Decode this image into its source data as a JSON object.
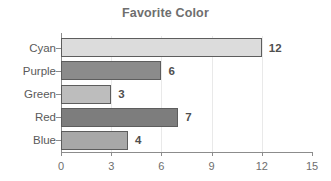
{
  "chart_data": {
    "type": "bar",
    "orientation": "horizontal",
    "title": "Favorite Color",
    "xlabel": "",
    "ylabel": "",
    "categories": [
      "Cyan",
      "Purple",
      "Green",
      "Red",
      "Blue"
    ],
    "values": [
      12,
      6,
      3,
      7,
      4
    ],
    "value_labels": [
      "12",
      "6",
      "3",
      "7",
      "4"
    ],
    "xlim": [
      0,
      15
    ],
    "xticks": [
      0,
      3,
      6,
      9,
      12,
      15
    ],
    "xtick_labels": [
      "0",
      "3",
      "6",
      "9",
      "12",
      "15"
    ],
    "gridlines": [
      3,
      6,
      9,
      12
    ],
    "grid": true,
    "legend": null,
    "bar_colors": [
      "#dcdcdc",
      "#8b8b8b",
      "#bdbdbd",
      "#7d7d7d",
      "#a8a8a8"
    ],
    "bar_border_color": "#5d5d5d",
    "axis_color": "#8c8c8c",
    "grid_color": "#e9e9e9",
    "text_color": "#5a5a5a",
    "title_color": "#6e6e6e",
    "background_color": "#ffffff"
  }
}
